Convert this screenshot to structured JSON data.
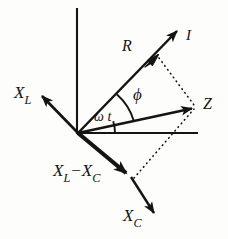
{
  "diagram": {
    "background_color": "#fdfdfb",
    "stroke_color": "#141414",
    "labels": {
      "inductive_reactance": "X",
      "inductive_reactance_sub": "L",
      "current": "I",
      "resistance": "R",
      "impedance": "Z",
      "phase_angle": "ϕ",
      "angular_time": "ω t",
      "net_reactance_first": "X",
      "net_reactance_first_sub": "L",
      "net_reactance_operator": "−",
      "net_reactance_second": "X",
      "net_reactance_second_sub": "C",
      "capacitive_reactance": "X",
      "capacitive_reactance_sub": "C"
    },
    "geometry": {
      "origin": [
        78,
        133
      ],
      "vertical_axis": [
        [
          77,
          8
        ],
        [
          77,
          133
        ]
      ],
      "horizontal_axis": [
        [
          78,
          133
        ],
        [
          198,
          133
        ]
      ],
      "vector_current": [
        [
          78,
          133
        ],
        [
          181,
          27
        ]
      ],
      "arrowhead_resistance": [
        157,
        55
      ],
      "vector_impedance": [
        [
          78,
          133
        ],
        [
          197,
          107
        ]
      ],
      "vector_inductive": [
        [
          78,
          133
        ],
        [
          37,
          91
        ]
      ],
      "vector_net_reactance": [
        [
          78,
          133
        ],
        [
          131,
          177
        ]
      ],
      "vector_capacitive": [
        [
          131,
          177
        ],
        [
          159,
          219
        ]
      ],
      "dotted_r_to_z": [
        [
          158,
          57
        ],
        [
          194,
          106
        ]
      ],
      "dotted_xlxc_to_z": [
        [
          133,
          177
        ],
        [
          194,
          108
        ]
      ],
      "arc_omega_t_radius": 37,
      "arc_phi_radius": 56
    }
  }
}
